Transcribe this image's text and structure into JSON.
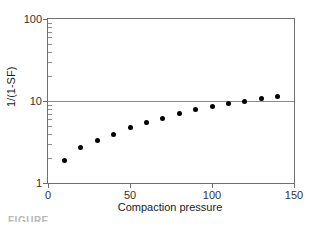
{
  "figure": {
    "background_color": "#ffffff",
    "frame_color": "#6f6f6f",
    "marker_color": "#000000",
    "gridline_color": "#8c8c8c",
    "caption_fragment": "FIGURE"
  },
  "chart_data": {
    "type": "scatter",
    "title": "",
    "xlabel": "Compaction pressure",
    "ylabel": "1/(1-SF)",
    "xscale": "linear",
    "yscale": "log",
    "xlim": [
      0,
      150
    ],
    "ylim": [
      1,
      100
    ],
    "grid": true,
    "gridlines_y": [
      10
    ],
    "legend": null,
    "x_ticks": [
      0,
      50,
      100,
      150
    ],
    "x_tick_labels": [
      "0",
      "50",
      "100",
      "150"
    ],
    "y_ticks": [
      1,
      10,
      100
    ],
    "y_tick_labels": [
      "1",
      "10",
      "100"
    ],
    "y_minor_ticks": [
      2,
      3,
      4,
      5,
      6,
      7,
      8,
      9,
      20,
      30,
      40,
      50,
      60,
      70,
      80,
      90
    ],
    "x": [
      10,
      20,
      30,
      40,
      50,
      60,
      70,
      80,
      90,
      100,
      110,
      120,
      130,
      140
    ],
    "values": [
      1.9,
      2.7,
      3.3,
      3.9,
      4.7,
      5.4,
      6.2,
      7.0,
      7.8,
      8.5,
      9.3,
      10.0,
      10.8,
      11.5
    ],
    "marker": "filled-circle",
    "marker_size_px": 5
  }
}
